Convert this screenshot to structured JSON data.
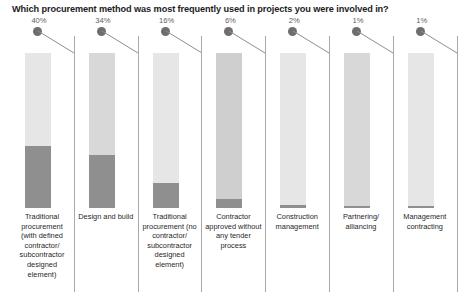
{
  "chart_data": {
    "type": "bar",
    "title": "Which procurement method was most frequently used in projects you were involved in?",
    "xlabel": "",
    "ylabel": "",
    "ylim": [
      0,
      100
    ],
    "grid": false,
    "legend": "none",
    "value_suffix": "%",
    "categories": [
      "Traditional procurement (with defined contractor/ subcontractor designed element)",
      "Design and build",
      "Traditional procurement (no contractor/ subcontractor designed element)",
      "Contractor approved without any tender process",
      "Construction management",
      "Partnering/ alliancing",
      "Management contracting"
    ],
    "values": [
      40,
      34,
      16,
      6,
      2,
      1,
      1
    ],
    "value_labels": [
      "40%",
      "34%",
      "16%",
      "6%",
      "2%",
      "1%",
      "1%"
    ]
  },
  "colors": {
    "fill": "#8f8f8f",
    "track": "#e6e6e6",
    "track_mid": "#d8d8d8",
    "track_dark": "#cfcfcf",
    "dot": "#6e6e6e",
    "leader": "#8d8d8d",
    "divider": "#a9a9a9",
    "title_text": "#1c1c1c",
    "value_text": "#5e5e5e",
    "category_text": "#1f1f1f",
    "background": "#ffffff"
  },
  "bars": [
    {
      "name": "traditional-with-designed-element",
      "value_label": "40%",
      "value": 40,
      "category": "Traditional procurement (with defined contractor/ subcontractor designed element)",
      "track_shade": "light"
    },
    {
      "name": "design-and-build",
      "value_label": "34%",
      "value": 34,
      "category": "Design and build",
      "track_shade": "mid"
    },
    {
      "name": "traditional-no-designed-element",
      "value_label": "16%",
      "value": 16,
      "category": "Traditional procurement (no contractor/ subcontractor designed element)",
      "track_shade": "light"
    },
    {
      "name": "contractor-approved-no-tender",
      "value_label": "6%",
      "value": 6,
      "category": "Contractor approved without any tender process",
      "track_shade": "dark"
    },
    {
      "name": "construction-management",
      "value_label": "2%",
      "value": 2,
      "category": "Construction management",
      "track_shade": "light"
    },
    {
      "name": "partnering-alliancing",
      "value_label": "1%",
      "value": 1,
      "category": "Partnering/ alliancing",
      "track_shade": "mid"
    },
    {
      "name": "management-contracting",
      "value_label": "1%",
      "value": 1,
      "category": "Management contracting",
      "track_shade": "light"
    }
  ]
}
